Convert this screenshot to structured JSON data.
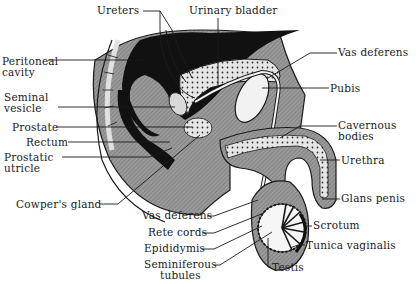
{
  "diagram": {
    "title": "",
    "labels": [
      {
        "id": "ureters",
        "text": "Ureters",
        "x": 97,
        "y": 5
      },
      {
        "id": "urinary-bladder",
        "text": "Urinary bladder",
        "x": 189,
        "y": 5
      },
      {
        "id": "peritoneal-cavity",
        "text": "Peritoneal\ncavity",
        "x": 2,
        "y": 56
      },
      {
        "id": "vas-deferens-top",
        "text": "Vas deferens",
        "x": 338,
        "y": 47
      },
      {
        "id": "pubis",
        "text": "Pubis",
        "x": 330,
        "y": 83
      },
      {
        "id": "seminal-vesicle",
        "text": "Seminal\nvesicle",
        "x": 4,
        "y": 92
      },
      {
        "id": "prostate",
        "text": "Prostate",
        "x": 12,
        "y": 122
      },
      {
        "id": "rectum",
        "text": "Rectum",
        "x": 26,
        "y": 137
      },
      {
        "id": "cavernous-bodies",
        "text": "Cavernous\nbodies",
        "x": 338,
        "y": 120
      },
      {
        "id": "prostatic-utricle",
        "text": "Prostatic\nutricle",
        "x": 4,
        "y": 152
      },
      {
        "id": "urethra",
        "text": "Urethra",
        "x": 341,
        "y": 155
      },
      {
        "id": "cowpers-gland",
        "text": "Cowper's gland",
        "x": 16,
        "y": 199
      },
      {
        "id": "glans-penis",
        "text": "Glans penis",
        "x": 341,
        "y": 193
      },
      {
        "id": "vas-deferens-bottom",
        "text": "Vas deferens",
        "x": 142,
        "y": 210
      },
      {
        "id": "rete-cords",
        "text": "Rete cords",
        "x": 148,
        "y": 227
      },
      {
        "id": "scrotum",
        "text": "Scrotum",
        "x": 313,
        "y": 220
      },
      {
        "id": "epididymis",
        "text": "Epididymis",
        "x": 144,
        "y": 243
      },
      {
        "id": "tunica-vaginalis",
        "text": "Tunica vaginalis",
        "x": 306,
        "y": 240
      },
      {
        "id": "seminiferous-tubules",
        "text": "Seminiferous\ntubules",
        "x": 144,
        "y": 259
      },
      {
        "id": "testis",
        "text": "Testis",
        "x": 272,
        "y": 262
      }
    ],
    "colors": {
      "ink": "#1a1a1a",
      "dark_fill": "#111111",
      "mid_gray": "#8a8a8a",
      "light_gray": "#c8c8c8",
      "paper": "#ffffff"
    }
  }
}
